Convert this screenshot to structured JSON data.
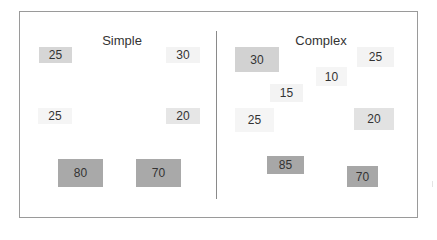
{
  "panels": {
    "simple": {
      "title": "Simple",
      "boxes": [
        {
          "label": "25",
          "color": "#d6d6d6"
        },
        {
          "label": "30",
          "color": "#f3f3f3"
        },
        {
          "label": "25",
          "color": "#f5f5f5"
        },
        {
          "label": "20",
          "color": "#e6e6e6"
        },
        {
          "label": "80",
          "color": "#a9a9a9"
        },
        {
          "label": "70",
          "color": "#a9a9a9"
        }
      ]
    },
    "complex": {
      "title": "Complex",
      "boxes": [
        {
          "label": "30",
          "color": "#d2d2d2"
        },
        {
          "label": "25",
          "color": "#f3f3f3"
        },
        {
          "label": "10",
          "color": "#f5f5f5"
        },
        {
          "label": "15",
          "color": "#f3f3f3"
        },
        {
          "label": "25",
          "color": "#f5f5f5"
        },
        {
          "label": "20",
          "color": "#e2e2e2"
        },
        {
          "label": "85",
          "color": "#a7a7a7"
        },
        {
          "label": "70",
          "color": "#a7a7a7"
        }
      ]
    }
  }
}
